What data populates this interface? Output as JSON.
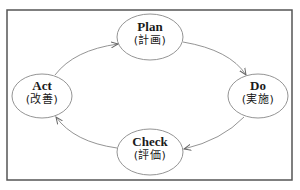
{
  "diagram": {
    "type": "cycle",
    "frame": {
      "x": 7,
      "y": 10,
      "width": 285,
      "height": 170,
      "stroke": "#555555"
    },
    "colors": {
      "ellipse_stroke": "#888888",
      "arrow_stroke": "#888888",
      "text": "#1a1a1a",
      "background": "#ffffff"
    },
    "nodes": [
      {
        "id": "plan",
        "title": "Plan",
        "subtitle": "(計画)",
        "cx": 150,
        "cy": 37,
        "rx": 33,
        "ry": 23
      },
      {
        "id": "do",
        "title": "Do",
        "subtitle": "(実施)",
        "cx": 258,
        "cy": 96,
        "rx": 30,
        "ry": 22
      },
      {
        "id": "check",
        "title": "Check",
        "subtitle": "(評価)",
        "cx": 150,
        "cy": 152,
        "rx": 33,
        "ry": 23
      },
      {
        "id": "act",
        "title": "Act",
        "subtitle": "(改善)",
        "cx": 42,
        "cy": 96,
        "rx": 30,
        "ry": 22
      }
    ],
    "edges": [
      {
        "from": "plan",
        "to": "do"
      },
      {
        "from": "do",
        "to": "check"
      },
      {
        "from": "check",
        "to": "act"
      },
      {
        "from": "act",
        "to": "plan"
      }
    ]
  }
}
